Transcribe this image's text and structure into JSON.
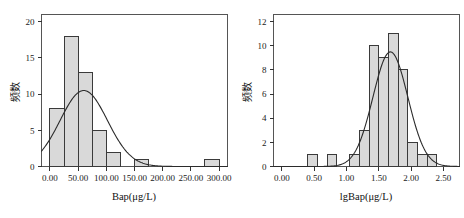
{
  "figure": {
    "background": "#ffffff",
    "bar_fill": "#d9d9d9",
    "bar_stroke": "#3a3a3a",
    "curve_color": "#2b2b2b"
  },
  "chart_data": [
    {
      "type": "bar",
      "name": "bap-histogram",
      "title": "",
      "xlabel": "Bap(μg/L)",
      "ylabel": "频数",
      "xlim": [
        -15,
        315
      ],
      "ylim": [
        0,
        21
      ],
      "grid": false,
      "legend": "none",
      "xticks": [
        0,
        50,
        100,
        150,
        200,
        250,
        300
      ],
      "xtick_labels": [
        "0.00",
        "50.00",
        "100.00",
        "150.00",
        "200.00",
        "250.00",
        "300.00"
      ],
      "yticks": [
        0,
        5,
        10,
        15,
        20
      ],
      "ytick_labels": [
        "0",
        "5",
        "10",
        "15",
        "20"
      ],
      "bin_width": 25,
      "bins": [
        {
          "x0": 0,
          "x1": 25,
          "count": 8
        },
        {
          "x0": 25,
          "x1": 50,
          "count": 18
        },
        {
          "x0": 50,
          "x1": 75,
          "count": 13
        },
        {
          "x0": 75,
          "x1": 100,
          "count": 5
        },
        {
          "x0": 100,
          "x1": 125,
          "count": 2
        },
        {
          "x0": 150,
          "x1": 175,
          "count": 1
        },
        {
          "x0": 275,
          "x1": 300,
          "count": 1
        }
      ],
      "normal_curve": {
        "mean": 60,
        "std": 42,
        "peak": 10.5,
        "description": "normal distribution fit overlay"
      }
    },
    {
      "type": "bar",
      "name": "lgbap-histogram",
      "title": "",
      "xlabel": "lgBap(μg/L)",
      "ylabel": "频数",
      "xlim": [
        -0.13,
        2.75
      ],
      "ylim": [
        0,
        12.6
      ],
      "grid": false,
      "legend": "none",
      "xticks": [
        0.0,
        0.5,
        1.0,
        1.5,
        2.0,
        2.5
      ],
      "xtick_labels": [
        "0.00",
        "0.50",
        "1.00",
        "1.50",
        "2.00",
        "2.50"
      ],
      "yticks": [
        0,
        2,
        4,
        6,
        8,
        10,
        12
      ],
      "ytick_labels": [
        "0",
        "2",
        "4",
        "6",
        "8",
        "10",
        "12"
      ],
      "bin_width": 0.15,
      "bins": [
        {
          "x0": 0.4,
          "x1": 0.55,
          "count": 1
        },
        {
          "x0": 0.7,
          "x1": 0.85,
          "count": 1
        },
        {
          "x0": 1.05,
          "x1": 1.2,
          "count": 1
        },
        {
          "x0": 1.2,
          "x1": 1.35,
          "count": 3
        },
        {
          "x0": 1.35,
          "x1": 1.5,
          "count": 10
        },
        {
          "x0": 1.5,
          "x1": 1.65,
          "count": 9
        },
        {
          "x0": 1.65,
          "x1": 1.8,
          "count": 11
        },
        {
          "x0": 1.8,
          "x1": 1.95,
          "count": 8
        },
        {
          "x0": 1.95,
          "x1": 2.1,
          "count": 2
        },
        {
          "x0": 2.1,
          "x1": 2.25,
          "count": 1
        },
        {
          "x0": 2.25,
          "x1": 2.4,
          "count": 1
        }
      ],
      "normal_curve": {
        "mean": 1.68,
        "std": 0.27,
        "peak": 9.5,
        "description": "normal distribution fit overlay"
      }
    }
  ]
}
